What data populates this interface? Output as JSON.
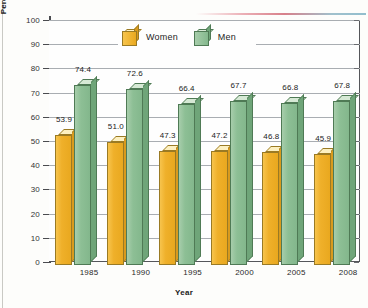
{
  "chart_data": {
    "type": "bar",
    "title": "",
    "xlabel": "Year",
    "ylabel": "Percentage Describing Their Health as \"Above Average\"",
    "ylabel_line1": "Percentage Describing Their Health",
    "ylabel_line2": "as \"Above Average\"",
    "categories": [
      "1985",
      "1990",
      "1995",
      "2000",
      "2005",
      "2008"
    ],
    "series": [
      {
        "name": "Women",
        "color": "#efb02a",
        "values": [
          53.9,
          51.0,
          47.3,
          47.2,
          46.8,
          45.9
        ]
      },
      {
        "name": "Men",
        "color": "#8dbf95",
        "values": [
          74.4,
          72.6,
          66.4,
          67.7,
          66.8,
          67.8
        ]
      }
    ],
    "ylim": [
      0,
      100
    ],
    "yticks": [
      0,
      10,
      20,
      30,
      40,
      50,
      60,
      70,
      80,
      90,
      100
    ],
    "ytick_labels": [
      "0",
      "10",
      "20",
      "30",
      "40",
      "50",
      "60",
      "70",
      "80",
      "90",
      "100"
    ],
    "grid": true,
    "legend_position": "top-center",
    "data_labels": [
      "53.9",
      "74.4",
      "51.0",
      "72.6",
      "47.3",
      "66.4",
      "47.2",
      "67.7",
      "46.8",
      "66.8",
      "45.9",
      "67.8"
    ]
  },
  "legend": {
    "items": [
      {
        "label": "Women",
        "icon": "orange-cube-icon"
      },
      {
        "label": "Men",
        "icon": "green-cube-icon"
      }
    ]
  },
  "axes": {
    "x_title": "Year",
    "y_title_line1": "Percentage Describing Their Health",
    "y_title_line2": "as \"Above Average\""
  }
}
